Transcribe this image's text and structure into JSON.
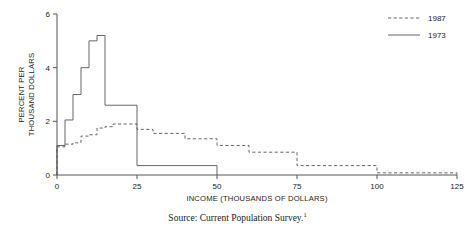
{
  "chart_data": {
    "type": "line",
    "title": "",
    "xlabel": "INCOME (THOUSANDS OF DOLLARS)",
    "ylabel_line1": "PERCENT PER",
    "ylabel_line2": "THOUSAND DOLLARS",
    "xlim": [
      0,
      125
    ],
    "ylim": [
      0,
      6
    ],
    "xticks": [
      0,
      25,
      50,
      75,
      100,
      125
    ],
    "yticks": [
      0,
      2,
      4,
      6
    ],
    "xtick_labels": [
      "0",
      "25",
      "50",
      "75",
      "100",
      "125"
    ],
    "ytick_labels": [
      "0",
      "2",
      "4",
      "6"
    ],
    "grid": false,
    "legend_position": "top-right",
    "series": [
      {
        "name": "1987",
        "style": "dashed",
        "color": "#555555",
        "bin_edges": [
          0,
          2.5,
          5,
          7.5,
          10,
          12.5,
          15,
          17.5,
          20,
          25,
          30,
          40,
          50,
          60,
          75,
          100,
          125
        ],
        "values": [
          1.05,
          1.15,
          1.2,
          1.45,
          1.5,
          1.75,
          1.8,
          1.9,
          1.9,
          1.7,
          1.55,
          1.35,
          1.1,
          0.85,
          0.35,
          0.08
        ]
      },
      {
        "name": "1973",
        "style": "solid",
        "color": "#555555",
        "bin_edges": [
          0,
          2.5,
          5,
          7.5,
          10,
          12.5,
          15,
          25,
          50
        ],
        "values": [
          1.1,
          2.05,
          3.0,
          4.0,
          5.0,
          5.2,
          2.6,
          0.35
        ]
      }
    ],
    "legend": [
      {
        "label": "1987",
        "style": "dashed"
      },
      {
        "label": "1973",
        "style": "solid"
      }
    ]
  },
  "footnote": {
    "text": "Source: Current Population Survey.",
    "marker": "1"
  }
}
